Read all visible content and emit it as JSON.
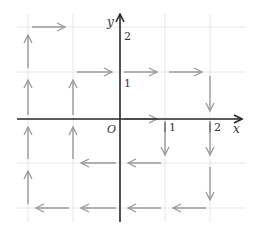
{
  "diagram": {
    "axes": {
      "x_label": "x",
      "y_label": "y",
      "origin_label": "O",
      "x_ticks": [
        {
          "value": 1,
          "label": "1"
        },
        {
          "value": 2,
          "label": "2"
        }
      ],
      "y_ticks": [
        {
          "value": 1,
          "label": "1"
        },
        {
          "value": 2,
          "label": "2"
        }
      ]
    },
    "grid": {
      "x_range": [
        -2,
        2
      ],
      "y_range": [
        -2,
        2
      ],
      "step": 1
    },
    "colors": {
      "axis": "#2a2a2a",
      "grid": "#e6e6e6",
      "vector": "#9a9a9a"
    },
    "vectors": [
      {
        "from": [
          -2,
          2
        ],
        "to": [
          -1,
          2
        ]
      },
      {
        "from": [
          -2,
          1
        ],
        "to": [
          -2,
          2
        ]
      },
      {
        "from": [
          -1,
          1
        ],
        "to": [
          0,
          1
        ]
      },
      {
        "from": [
          0,
          1
        ],
        "to": [
          1,
          1
        ]
      },
      {
        "from": [
          1,
          1
        ],
        "to": [
          2,
          1
        ]
      },
      {
        "from": [
          2,
          1
        ],
        "to": [
          2,
          0
        ]
      },
      {
        "from": [
          -2,
          0
        ],
        "to": [
          -2,
          1
        ]
      },
      {
        "from": [
          -1,
          0
        ],
        "to": [
          -1,
          1
        ]
      },
      {
        "from": [
          0,
          0
        ],
        "to": [
          1,
          0
        ]
      },
      {
        "from": [
          1,
          0
        ],
        "to": [
          1,
          -1
        ]
      },
      {
        "from": [
          2,
          0
        ],
        "to": [
          2,
          -1
        ]
      },
      {
        "from": [
          -2,
          -1
        ],
        "to": [
          -2,
          0
        ]
      },
      {
        "from": [
          -1,
          -1
        ],
        "to": [
          -1,
          0
        ]
      },
      {
        "from": [
          0,
          -1
        ],
        "to": [
          -1,
          -1
        ]
      },
      {
        "from": [
          1,
          -1
        ],
        "to": [
          0,
          -1
        ]
      },
      {
        "from": [
          2,
          -1
        ],
        "to": [
          2,
          -2
        ]
      },
      {
        "from": [
          -2,
          -2
        ],
        "to": [
          -2,
          -1
        ]
      },
      {
        "from": [
          -1,
          -2
        ],
        "to": [
          -2,
          -2
        ]
      },
      {
        "from": [
          0,
          -2
        ],
        "to": [
          -1,
          -2
        ]
      },
      {
        "from": [
          1,
          -2
        ],
        "to": [
          0,
          -2
        ]
      },
      {
        "from": [
          2,
          -2
        ],
        "to": [
          1,
          -2
        ]
      }
    ]
  }
}
